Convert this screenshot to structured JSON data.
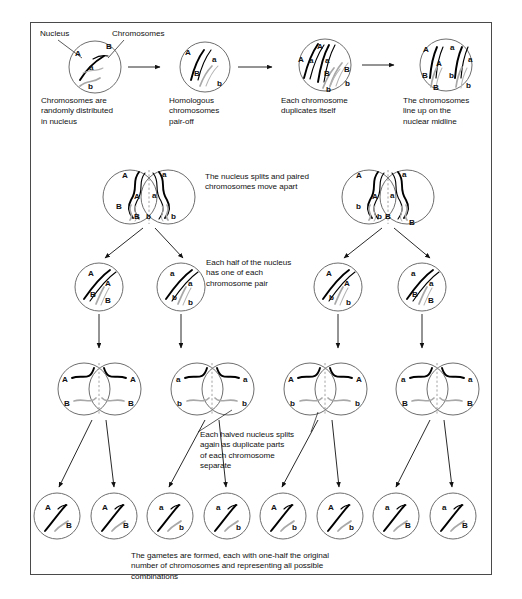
{
  "figure": {
    "title_visible": false,
    "border_color": "#4a4a4a",
    "dark_chromosome_color": "#000000",
    "light_chromosome_color": "#a8a8a8",
    "nucleus_outline_color": "#6e6e6e",
    "midline_color": "#9a9a9a"
  },
  "callouts": {
    "nucleus": "Nucleus",
    "chromosomes": "Chromosomes"
  },
  "stage_captions": {
    "s1": "Chromosomes are\nrandomly distributed\nin nucleus",
    "s2": "Homologous\nchromosomes\npair-off",
    "s3": "Each chromosome\nduplicates itself",
    "s4": "The chromosomes\nline up on the\nnuclear midline",
    "s5": "The nucleus splits and paired\nchromosomes move apart",
    "s6": "Each half of the nucleus\nhas one of each\nchromosome pair",
    "s7": "Each halved nucleus splits\nagain as duplicate parts\nof each chromosome\nseparate",
    "s8": "The gametes are formed, each with one-half the original\nnumber of chromosomes and representing all possible\ncombinations"
  },
  "row1": {
    "cells": [
      {
        "name": "nucleus-random",
        "labels": [
          "A",
          "B",
          "a",
          "b"
        ]
      },
      {
        "name": "nucleus-paired",
        "labels": [
          "A",
          "a",
          "B",
          "b"
        ]
      },
      {
        "name": "nucleus-duplicated",
        "labels": [
          "A",
          "A",
          "a",
          "a",
          "B",
          "B",
          "b",
          "b"
        ]
      },
      {
        "name": "nucleus-midline",
        "labels": [
          "A",
          "A",
          "a",
          "a",
          "B",
          "B",
          "b",
          "b"
        ]
      }
    ]
  },
  "row2": {
    "cells": [
      {
        "name": "split-nucleus-left",
        "left_top": "A",
        "left_top2": "A",
        "right_top": "a",
        "right_top2": "a",
        "left_bot": "B",
        "left_bot2": "B",
        "right_bot": "b",
        "right_bot2": "b"
      },
      {
        "name": "split-nucleus-right",
        "left_top": "A",
        "left_top2": "A",
        "right_top": "a",
        "right_top2": "a",
        "left_bot": "b",
        "left_bot2": "b",
        "right_bot": "B",
        "right_bot2": "B"
      }
    ]
  },
  "row3": {
    "cells": [
      {
        "name": "half-nucleus-1",
        "labels": [
          "A",
          "A",
          "B",
          "B"
        ]
      },
      {
        "name": "half-nucleus-2",
        "labels": [
          "a",
          "a",
          "b",
          "b"
        ]
      },
      {
        "name": "half-nucleus-3",
        "labels": [
          "A",
          "A",
          "b",
          "b"
        ]
      },
      {
        "name": "half-nucleus-4",
        "labels": [
          "a",
          "a",
          "B",
          "B"
        ]
      }
    ]
  },
  "row4": {
    "cells": [
      {
        "name": "dividing-nucleus-1",
        "top_left": "A",
        "top_right": "A",
        "bot_left": "B",
        "bot_right": "B"
      },
      {
        "name": "dividing-nucleus-2",
        "top_left": "a",
        "top_right": "a",
        "bot_left": "b",
        "bot_right": "b"
      },
      {
        "name": "dividing-nucleus-3",
        "top_left": "A",
        "top_right": "A",
        "bot_left": "b",
        "bot_right": "b"
      },
      {
        "name": "dividing-nucleus-4",
        "top_left": "a",
        "top_right": "a",
        "bot_left": "B",
        "bot_right": "B"
      }
    ]
  },
  "row5": {
    "gametes": [
      {
        "name": "gamete-1",
        "top": "A",
        "bottom": "B"
      },
      {
        "name": "gamete-2",
        "top": "A",
        "bottom": "B"
      },
      {
        "name": "gamete-3",
        "top": "a",
        "bottom": "b"
      },
      {
        "name": "gamete-4",
        "top": "a",
        "bottom": "b"
      },
      {
        "name": "gamete-5",
        "top": "A",
        "bottom": "b"
      },
      {
        "name": "gamete-6",
        "top": "A",
        "bottom": "b"
      },
      {
        "name": "gamete-7",
        "top": "a",
        "bottom": "B"
      },
      {
        "name": "gamete-8",
        "top": "a",
        "bottom": "B"
      }
    ]
  }
}
